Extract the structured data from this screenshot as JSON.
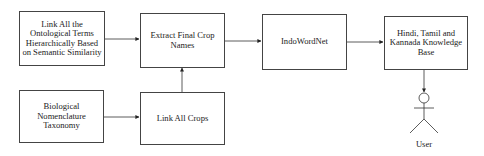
{
  "diagram": {
    "type": "flowchart",
    "nodes": [
      {
        "id": "link_ontological",
        "label": "Link All the Ontological Terms Hierarchically Based on Semantic Similarity"
      },
      {
        "id": "extract_final",
        "label": "Extract Final Crop Names"
      },
      {
        "id": "indowordnet",
        "label": "IndoWordNet"
      },
      {
        "id": "knowledge_base",
        "label": "Hindi, Tamil and Kannada Knowledge Base"
      },
      {
        "id": "bio_nomenclature",
        "label": "Biological Nomenclature Taxonomy"
      },
      {
        "id": "link_crops",
        "label": "Link All Crops"
      },
      {
        "id": "user",
        "label": "User"
      }
    ],
    "edges": [
      {
        "from": "link_ontological",
        "to": "extract_final"
      },
      {
        "from": "extract_final",
        "to": "indowordnet"
      },
      {
        "from": "indowordnet",
        "to": "knowledge_base"
      },
      {
        "from": "bio_nomenclature",
        "to": "link_crops"
      },
      {
        "from": "link_crops",
        "to": "extract_final"
      },
      {
        "from": "knowledge_base",
        "to": "user"
      }
    ]
  },
  "boxes": {
    "b1": "Link All the Ontological Terms Hierarchically Based on Semantic Similarity",
    "b2": "Extract Final Crop Names",
    "b3": "IndoWordNet",
    "b4": "Hindi, Tamil and Kannada Knowledge Base",
    "b5": "Biological Nomenclature Taxonomy",
    "b6": "Link All Crops"
  },
  "actor": {
    "label": "User"
  }
}
